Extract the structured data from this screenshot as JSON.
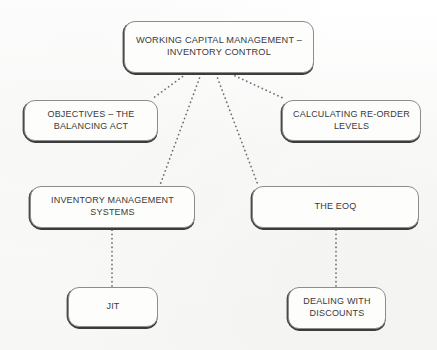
{
  "diagram": {
    "type": "hierarchy-mind-map",
    "background_color": "#fcfcfb",
    "node_fill_color": "#fdfdfc",
    "node_border_color": "#8d8d8d",
    "node_shadow_color": "#3c3c3c",
    "text_color": "#3a3a3a",
    "connector_color": "#6f6f6f",
    "connector_style": "dotted",
    "nodes": [
      {
        "id": "root",
        "label": "WORKING CAPITAL MANAGEMENT –\nINVENTORY CONTROL",
        "level": 0
      },
      {
        "id": "objectives",
        "label": "OBJECTIVES – THE\nBALANCING ACT",
        "level": 1
      },
      {
        "id": "reorder",
        "label": "CALCULATING RE-ORDER\nLEVELS",
        "level": 1
      },
      {
        "id": "inventory_systems",
        "label": "INVENTORY MANAGEMENT\nSYSTEMS",
        "level": 1
      },
      {
        "id": "eoq",
        "label": "THE EOQ",
        "level": 1
      },
      {
        "id": "jit",
        "label": "JIT",
        "level": 2
      },
      {
        "id": "discounts",
        "label": "DEALING WITH\nDISCOUNTS",
        "level": 2
      }
    ],
    "edges": [
      {
        "from": "root",
        "to": "objectives"
      },
      {
        "from": "root",
        "to": "inventory_systems"
      },
      {
        "from": "root",
        "to": "eoq"
      },
      {
        "from": "root",
        "to": "reorder"
      },
      {
        "from": "inventory_systems",
        "to": "jit"
      },
      {
        "from": "eoq",
        "to": "discounts"
      }
    ]
  }
}
